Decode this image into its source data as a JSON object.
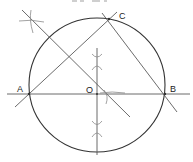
{
  "figure": {
    "type": "geometry-construction",
    "points": [
      {
        "id": "A",
        "label": "A"
      },
      {
        "id": "B",
        "label": "B"
      },
      {
        "id": "C",
        "label": "C"
      },
      {
        "id": "O",
        "label": "O"
      }
    ],
    "segments": [
      {
        "id": "AB",
        "from": "A",
        "to": "B",
        "extended": true
      },
      {
        "id": "AC",
        "from": "A",
        "to": "C",
        "extended": true
      },
      {
        "id": "CB",
        "from": "C",
        "to": "B",
        "extended": true
      }
    ],
    "constructions": [
      {
        "id": "perp-bisector-AB",
        "kind": "perpendicular bisector",
        "of": "AB"
      },
      {
        "id": "perp-bisector-AC",
        "kind": "perpendicular bisector",
        "of": "AC"
      }
    ],
    "colors": {
      "line": "#5a5a5a",
      "circle": "#333333",
      "arc": "#8a8a8a",
      "text": "#222222"
    }
  }
}
